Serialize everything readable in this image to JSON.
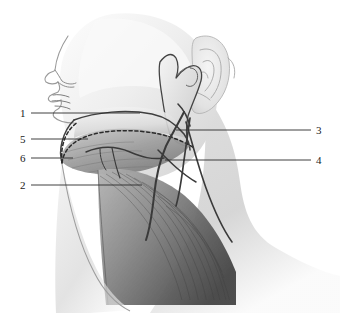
{
  "figure": {
    "background_color": "#ffffff",
    "ink_color": "#1a1a1a",
    "tissue_light": "#f2f2f2",
    "tissue_mid": "#b9b9b9",
    "tissue_dark": "#6e6e6e",
    "muscle_dark": "#4a4a4a"
  },
  "labels": [
    {
      "id": "label-1",
      "text": "1",
      "side": "left",
      "x": 20,
      "y": 108,
      "leader_from_x": 31,
      "leader_to_x": 140,
      "leader_y": 113
    },
    {
      "id": "label-5",
      "text": "5",
      "side": "left",
      "x": 20,
      "y": 134,
      "leader_from_x": 31,
      "leader_to_x": 88,
      "leader_y": 139
    },
    {
      "id": "label-6",
      "text": "6",
      "side": "left",
      "x": 20,
      "y": 153,
      "leader_from_x": 31,
      "leader_to_x": 73,
      "leader_y": 158
    },
    {
      "id": "label-2",
      "text": "2",
      "side": "left",
      "x": 20,
      "y": 180,
      "leader_from_x": 31,
      "leader_to_x": 142,
      "leader_y": 185
    },
    {
      "id": "label-3",
      "text": "3",
      "side": "right",
      "x": 316,
      "y": 125,
      "leader_from_x": 176,
      "leader_to_x": 311,
      "leader_y": 130
    },
    {
      "id": "label-4",
      "text": "4",
      "side": "right",
      "x": 316,
      "y": 155,
      "leader_from_x": 165,
      "leader_to_x": 311,
      "leader_y": 160
    }
  ],
  "structures": [
    {
      "name": "nose-profile"
    },
    {
      "name": "lips-profile"
    },
    {
      "name": "ear-auricle"
    },
    {
      "name": "mandible-body"
    },
    {
      "name": "mandible-ramus"
    },
    {
      "name": "submandibular-gland"
    },
    {
      "name": "dotted-incision-line"
    },
    {
      "name": "sternocleidomastoid-muscle"
    },
    {
      "name": "facial-vessels"
    },
    {
      "name": "retromandibular-vein"
    }
  ]
}
